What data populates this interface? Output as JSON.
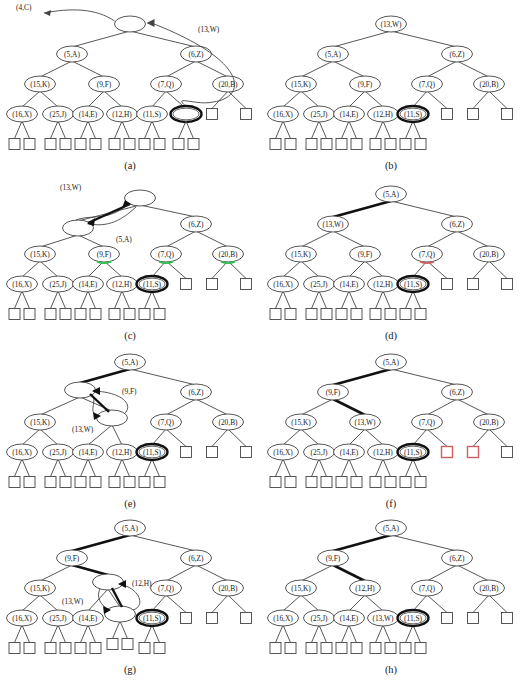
{
  "figure": {
    "type": "diagram",
    "panel_count": 8,
    "node_label_format": "(key,value)",
    "colors": {
      "stroke": "#444444",
      "text": "#1a1a1a",
      "highlight_thick": "#111111",
      "accent_green": "#2fbf4f",
      "accent_red": "#d06060",
      "background": "#ffffff"
    }
  },
  "panels": [
    {
      "id": "a",
      "caption": "(a)",
      "root_label": "",
      "floating_labels": [
        {
          "text": "(4,C)",
          "name": "label-4-C"
        },
        {
          "text": "(13,W)",
          "name": "label-13-W"
        }
      ],
      "nodes": {
        "root": "",
        "l": "(5,A)",
        "r": "(6,Z)",
        "ll": "(15,K)",
        "lr": "(9,F)",
        "rl": "(7,Q)",
        "rr": "(20,B)",
        "lll": "(16,X)",
        "llr": "(25,J)",
        "lrl": "(14,E)",
        "lrr": "(12,H)",
        "rll": "(11,S)",
        "rlr": ""
      },
      "bold_node": "rlr",
      "nil_leaves": 10
    },
    {
      "id": "b",
      "caption": "(b)",
      "nodes": {
        "root": "(13,W)",
        "l": "(5,A)",
        "r": "(6,Z)",
        "ll": "(15,K)",
        "lr": "(9,F)",
        "rl": "(7,Q)",
        "rr": "(20,B)",
        "lll": "(16,X)",
        "llr": "(25,J)",
        "lrl": "(14,E)",
        "lrr": "(12,H)",
        "rll": "(11,S)"
      },
      "bold_node": "rll",
      "nil_leaves": 8
    },
    {
      "id": "c",
      "caption": "(c)",
      "floating_labels": [
        {
          "text": "(13,W)",
          "name": "label-13-W"
        },
        {
          "text": "(5,A)",
          "name": "label-5-A"
        }
      ],
      "nodes": {
        "root": "",
        "l": "",
        "r": "(6,Z)",
        "ll": "(15,K)",
        "lr": "(9,F)",
        "rl": "(7,Q)",
        "rr": "(20,B)",
        "lll": "(16,X)",
        "llr": "(25,J)",
        "lrl": "(14,E)",
        "lrr": "(12,H)",
        "rll": "(11,S)"
      },
      "bold_node": "rll",
      "green_marks": [
        "lr",
        "rl",
        "rr"
      ],
      "rotation": "root-left-child swap"
    },
    {
      "id": "d",
      "caption": "(d)",
      "nodes": {
        "root": "(5,A)",
        "l": "(13,W)",
        "r": "(6,Z)",
        "ll": "(15,K)",
        "lr": "(9,F)",
        "rl": "(7,Q)",
        "rr": "(20,B)",
        "lll": "(16,X)",
        "llr": "(25,J)",
        "lrl": "(14,E)",
        "lrr": "(12,H)",
        "rll": "(11,S)"
      },
      "bold_node": "rll",
      "bold_edge": "root-l",
      "red_marks": [
        "rl"
      ]
    },
    {
      "id": "e",
      "caption": "(e)",
      "floating_labels": [
        {
          "text": "(9,F)",
          "name": "label-9-F"
        },
        {
          "text": "(13,W)",
          "name": "label-13-W"
        }
      ],
      "nodes": {
        "root": "(5,A)",
        "l": "",
        "r": "(6,Z)",
        "ll": "(15,K)",
        "lr": "",
        "rl": "(7,Q)",
        "rr": "(20,B)",
        "lll": "(16,X)",
        "llr": "(25,J)",
        "lrl": "(14,E)",
        "lrr": "(12,H)",
        "rll": "(11,S)"
      },
      "bold_node": "rll",
      "bold_edge": "root-l",
      "rotation": "l / lr swap"
    },
    {
      "id": "f",
      "caption": "(f)",
      "nodes": {
        "root": "(5,A)",
        "l": "(9,F)",
        "r": "(6,Z)",
        "ll": "(15,K)",
        "lr": "(13,W)",
        "rl": "(7,Q)",
        "rr": "(20,B)",
        "lll": "(16,X)",
        "llr": "(25,J)",
        "lrl": "(14,E)",
        "lrr": "(12,H)",
        "rll": "(11,S)"
      },
      "bold_node": "rll",
      "bold_edge": "root-l,l-lr",
      "red_marks": [
        "rl-right-leaf",
        "rr-left-leaf"
      ]
    },
    {
      "id": "g",
      "caption": "(g)",
      "floating_labels": [
        {
          "text": "(13,W)",
          "name": "label-13-W"
        },
        {
          "text": "(12,H)",
          "name": "label-12-H"
        }
      ],
      "nodes": {
        "root": "(5,A)",
        "l": "(9,F)",
        "r": "(6,Z)",
        "ll": "(15,K)",
        "lr": "",
        "rl": "(7,Q)",
        "rr": "(20,B)",
        "lll": "(16,X)",
        "llr": "(25,J)",
        "lrl": "(14,E)",
        "lrr": "",
        "rll": "(11,S)"
      },
      "bold_node": "rll",
      "bold_edge": "root-l,l-lr",
      "rotation": "lr / lrr swap"
    },
    {
      "id": "h",
      "caption": "(h)",
      "nodes": {
        "root": "(5,A)",
        "l": "(9,F)",
        "r": "(6,Z)",
        "ll": "(15,K)",
        "lr": "(12,H)",
        "rl": "(7,Q)",
        "rr": "(20,B)",
        "lll": "(16,X)",
        "llr": "(25,J)",
        "lrl": "(14,E)",
        "lrr": "(13,W)",
        "rll": "(11,S)"
      },
      "bold_node": "rll",
      "bold_edge": "root-l,l-lr"
    }
  ]
}
